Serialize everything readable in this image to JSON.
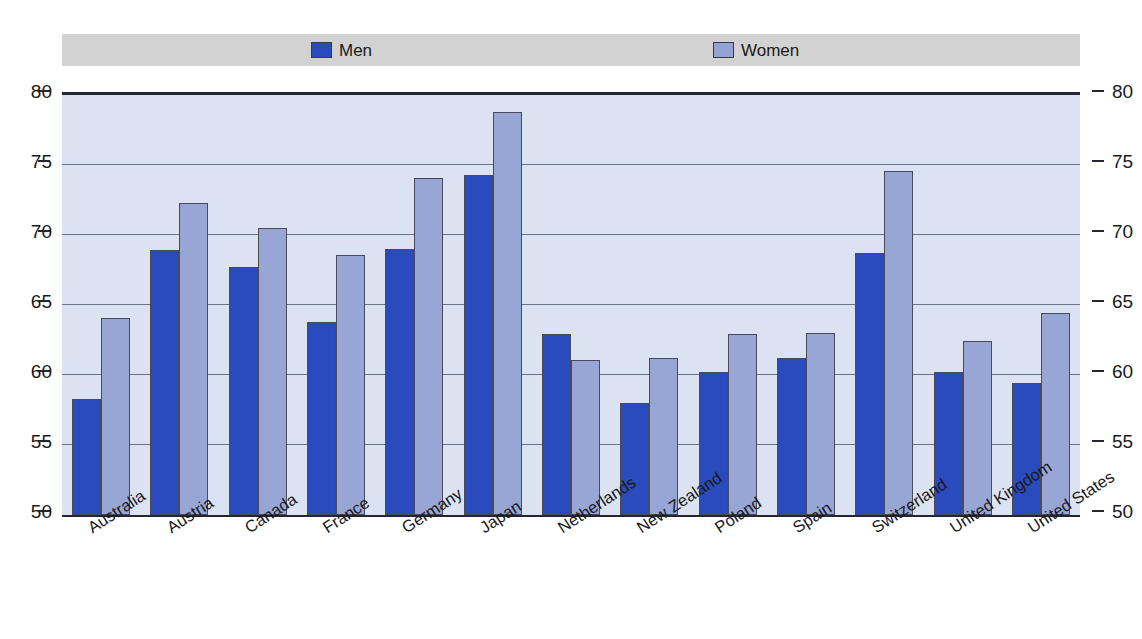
{
  "chart_data": {
    "type": "bar",
    "title": "",
    "subtitle": "",
    "xlabel": "",
    "ylabel": "",
    "ylim": [
      50,
      80
    ],
    "yticks": [
      50,
      55,
      60,
      65,
      70,
      75,
      80
    ],
    "ytick_labels": [
      "50",
      "55",
      "60",
      "65",
      "70",
      "75",
      "80"
    ],
    "dual_y_axis": true,
    "grid": true,
    "legend_position": "top",
    "categories": [
      "Australia",
      "Austria",
      "Canada",
      "France",
      "Germany",
      "Japan",
      "Netherlands",
      "New Zealand",
      "Poland",
      "Spain",
      "Switzerland",
      "United Kingdom",
      "United States"
    ],
    "series": [
      {
        "name": "Men",
        "color": "#2a4bbd",
        "values": [
          58.3,
          68.9,
          67.7,
          63.8,
          69.0,
          74.3,
          62.9,
          58.0,
          60.2,
          61.2,
          68.7,
          60.2,
          59.4
        ]
      },
      {
        "name": "Women",
        "color": "#98a6d6",
        "values": [
          64.1,
          72.3,
          70.5,
          68.6,
          74.1,
          78.8,
          61.1,
          61.2,
          62.9,
          63.0,
          74.6,
          62.4,
          64.4
        ]
      }
    ]
  },
  "legend": {
    "men_label": "Men",
    "women_label": "Women",
    "background_color": "#d2d2d2"
  },
  "colors": {
    "men": "#2a4bbd",
    "women": "#98a6d6",
    "plot_background": "#dbe3f2",
    "gridline": "#6b7486",
    "axis": "#25252f"
  }
}
